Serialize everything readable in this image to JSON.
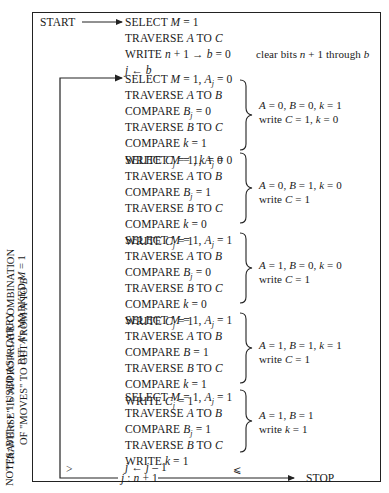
{
  "side_notes": {
    "traverse_line1": "\"TRAVERSE\" IS APPROPRIATE COMBINATION",
    "traverse_line2_pre": "OF \"MOVES\" TO GET FROM ",
    "traverse_line2_A": "A",
    "traverse_line2_mid": " TO ",
    "traverse_line2_B": "B",
    "notes_line1_pre": "NOTES:  BIT ",
    "notes_line1_n": "n",
    "notes_line1_mid": " + 1 USED AS ",
    "notes_line1_k": "k",
    "notes_line1_post": "–CARRY",
    "notes_line2_pre": "BIT.  ",
    "notes_line2_A": "A",
    "notes_line2_mid": "'s MARKED ",
    "notes_line2_M": "M",
    "notes_line2_post": " = 1"
  },
  "start_label": "START",
  "stop_label": "STOP",
  "init": {
    "l1": "SELECT M = 1",
    "l2": "TRAVERSE A TO C",
    "l3": "WRITE n + 1 → b = 0",
    "l4": "j ← b",
    "comment": "clear bits n + 1 through b"
  },
  "groups": [
    {
      "lines": [
        "SELECT M = 1, Aj = 0",
        "TRAVERSE A TO B",
        "COMPARE Bj = 0",
        "TRAVERSE B TO C",
        "COMPARE k = 1",
        "WRITE Cj = 1, k = 0"
      ],
      "comment1": "A = 0, B = 0, k = 1",
      "comment2": "write C = 1, k = 0"
    },
    {
      "lines": [
        "SELECT M = 1, Aj = 0",
        "TRAVERSE A TO B",
        "COMPARE Bj = 1",
        "TRAVERSE B TO C",
        "COMPARE k = 0",
        "WRITE Cj = 1"
      ],
      "comment1": "A = 0, B = 1, k = 0",
      "comment2": "write C = 1"
    },
    {
      "lines": [
        "SELECT M = 1, Aj = 1",
        "TRAVERSE A TO B",
        "COMPARE Bj = 0",
        "TRAVERSE B TO C",
        "COMPARE k = 0",
        "WRITE Cj = 1"
      ],
      "comment1": "A = 1, B = 0, k = 0",
      "comment2": "write C = 1"
    },
    {
      "lines": [
        "SELECT M = 1, Aj = 1",
        "TRAVERSE A TO B",
        "COMPARE B = 1",
        "TRAVERSE B TO C",
        "COMPARE k = 1",
        "WRITE Cj = 1"
      ],
      "comment1": "A = 1, B = 1, k = 1",
      "comment2": "write C = 1"
    },
    {
      "lines": [
        "SELECT M = 1, Aj = 1",
        "TRAVERSE A TO B",
        "COMPARE Bj = 1",
        "TRAVERSE B TO C",
        "WRITE k = 1"
      ],
      "comment1": "A = 1, B = 1",
      "comment2": "write k = 1"
    }
  ],
  "loop": {
    "decrement": "j ← j – 1",
    "compare": "j : n + 1",
    "gt_symbol": ">",
    "le_symbol": "⩽"
  }
}
